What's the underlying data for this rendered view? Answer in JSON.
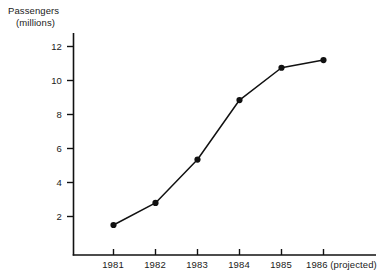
{
  "chart_data": {
    "type": "line",
    "title": "",
    "xlabel": "",
    "ylabel": "Passengers (millions)",
    "ylabel_lines": [
      "Passengers",
      "(millions)"
    ],
    "categories": [
      "1981",
      "1982",
      "1983",
      "1984",
      "1985",
      "1986 (projected)"
    ],
    "x_tick_labels": [
      "1981",
      "1982",
      "1983",
      "1984",
      "1985",
      "1986 (projected)"
    ],
    "y_tick_labels": [
      "2",
      "4",
      "6",
      "8",
      "10",
      "12"
    ],
    "y_ticks": [
      2,
      4,
      6,
      8,
      10,
      12
    ],
    "values": [
      1.5,
      2.8,
      5.35,
      8.85,
      10.75,
      11.2
    ],
    "series": [
      {
        "name": "Passengers",
        "values": [
          1.5,
          2.8,
          5.35,
          8.85,
          10.75,
          11.2
        ]
      }
    ],
    "ylim": [
      0,
      12.8
    ],
    "grid": false,
    "legend": false,
    "legend_position": "none",
    "marker": "filled-circle",
    "line_color": "#111111",
    "marker_color": "#111111",
    "axis_color": "#111111",
    "background_color": "#ffffff"
  },
  "axes": {
    "y_axis_title_line1": "Passengers",
    "y_axis_title_line2": "(millions)"
  }
}
